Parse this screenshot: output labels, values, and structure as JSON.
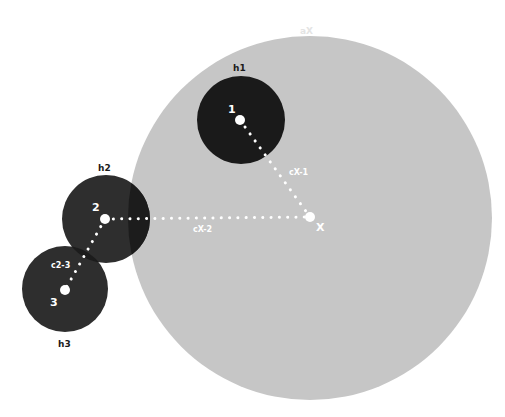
{
  "diagram": {
    "colors": {
      "background": "#ffffff",
      "big_circle": "#c6c6c6",
      "h1_fill": "#1a1a1a",
      "h2_fill": "#2e2e2e",
      "h3_fill": "#2e2e2e",
      "overlap": "#1c1c1c",
      "dots": "#ffffff",
      "outer_label": "#1a1a1a",
      "ax_label": "#e4e4e4"
    },
    "big_circle": {
      "label": "aX",
      "cx": 310,
      "cy": 218,
      "r": 182
    },
    "center_node": {
      "label": "X",
      "cx": 310,
      "cy": 217
    },
    "circles": [
      {
        "id": "h1",
        "label": "h1",
        "node_label": "1",
        "cx": 241,
        "cy": 120,
        "r": 44
      },
      {
        "id": "h2",
        "label": "h2",
        "node_label": "2",
        "cx": 106,
        "cy": 219,
        "r": 44
      },
      {
        "id": "h3",
        "label": "h3",
        "node_label": "3",
        "cx": 65,
        "cy": 289,
        "r": 43
      }
    ],
    "connections": [
      {
        "label": "cX-1",
        "from": "X",
        "to": "1"
      },
      {
        "label": "cX-2",
        "from": "X",
        "to": "2"
      },
      {
        "label": "c2-3",
        "from": "2",
        "to": "3"
      }
    ]
  }
}
